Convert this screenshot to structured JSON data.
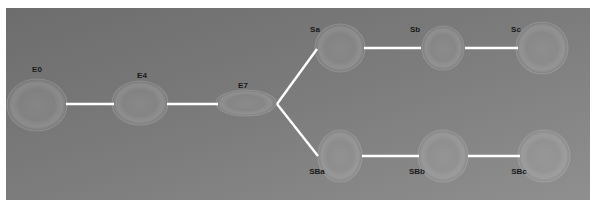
{
  "figure": {
    "title": "",
    "background": {
      "outer_color": "#ffffff",
      "plot_fill_top_left": "#6f6f6f",
      "plot_fill_bottom_right": "#8d8d8d",
      "plot_rect": {
        "x": 6,
        "y": 8,
        "width": 584,
        "height": 192
      }
    },
    "edge_color": "#ffffff",
    "node_halo_color": "#9a9a9a",
    "label_color": "#1a1a1a",
    "label_font_size_px": 8
  },
  "chart_data": {
    "type": "diagram",
    "subtype": "tree-graph",
    "title": "",
    "xlabel": "",
    "ylabel": "",
    "grid": false,
    "legend": null,
    "nodes": [
      {
        "id": "E0",
        "label": "E0",
        "x": 37,
        "y": 105,
        "rx": 30,
        "ry": 26,
        "label_x": 37,
        "label_y": 72
      },
      {
        "id": "E4",
        "label": "E4",
        "x": 140,
        "y": 103,
        "rx": 28,
        "ry": 22,
        "label_x": 142,
        "label_y": 78
      },
      {
        "id": "E7",
        "label": "E7",
        "x": 246,
        "y": 103,
        "rx": 30,
        "ry": 13,
        "label_x": 243,
        "label_y": 88
      },
      {
        "id": "Sa",
        "label": "Sa",
        "x": 340,
        "y": 48,
        "rx": 25,
        "ry": 24,
        "label_x": 315,
        "label_y": 32
      },
      {
        "id": "Sb",
        "label": "Sb",
        "x": 443,
        "y": 48,
        "rx": 21,
        "ry": 22,
        "label_x": 415,
        "label_y": 32
      },
      {
        "id": "Sc",
        "label": "Sc",
        "x": 542,
        "y": 48,
        "rx": 26,
        "ry": 26,
        "label_x": 516,
        "label_y": 32
      },
      {
        "id": "SBa",
        "label": "SBa",
        "x": 340,
        "y": 156,
        "rx": 22,
        "ry": 26,
        "label_x": 317,
        "label_y": 174
      },
      {
        "id": "SBb",
        "label": "SBb",
        "x": 443,
        "y": 156,
        "rx": 25,
        "ry": 26,
        "label_x": 417,
        "label_y": 174
      },
      {
        "id": "SBc",
        "label": "SBc",
        "x": 544,
        "y": 156,
        "rx": 26,
        "ry": 26,
        "label_x": 519,
        "label_y": 174
      }
    ],
    "edges": [
      {
        "source": "E0",
        "target": "E4",
        "x1": 66,
        "y1": 104,
        "x2": 114,
        "y2": 104
      },
      {
        "source": "E4",
        "target": "E7",
        "x1": 167,
        "y1": 104,
        "x2": 218,
        "y2": 104
      },
      {
        "source": "E7",
        "target": "Sa",
        "x1": 277,
        "y1": 104,
        "x2": 317,
        "y2": 49
      },
      {
        "source": "E7",
        "target": "SBa",
        "x1": 277,
        "y1": 104,
        "x2": 318,
        "y2": 156
      },
      {
        "source": "Sa",
        "target": "Sb",
        "x1": 364,
        "y1": 48,
        "x2": 421,
        "y2": 48
      },
      {
        "source": "Sb",
        "target": "Sc",
        "x1": 465,
        "y1": 48,
        "x2": 518,
        "y2": 48
      },
      {
        "source": "SBa",
        "target": "SBb",
        "x1": 362,
        "y1": 156,
        "x2": 419,
        "y2": 156
      },
      {
        "source": "SBb",
        "target": "SBc",
        "x1": 468,
        "y1": 156,
        "x2": 520,
        "y2": 156
      }
    ]
  }
}
